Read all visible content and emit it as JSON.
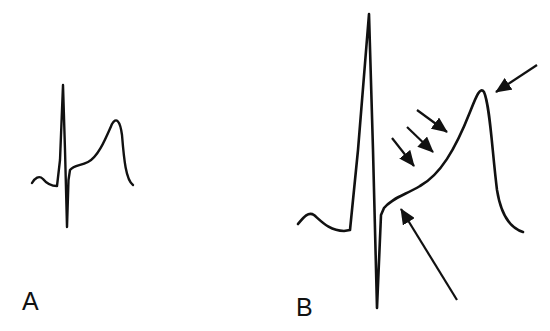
{
  "figure": {
    "panels": [
      {
        "id": "A",
        "label": "A"
      },
      {
        "id": "B",
        "label": "B"
      }
    ],
    "colors": {
      "ink": "#111111",
      "background": "#ffffff"
    },
    "annotations": {
      "panel_B_arrows": [
        {
          "name": "t-wave-peak-arrow",
          "points_to": "T wave peak"
        },
        {
          "name": "st-slope-arrow-1",
          "points_to": "ST segment upslope"
        },
        {
          "name": "st-slope-arrow-2",
          "points_to": "ST segment upslope"
        },
        {
          "name": "st-slope-arrow-3",
          "points_to": "ST segment upslope"
        },
        {
          "name": "j-point-arrow",
          "points_to": "J point"
        }
      ]
    }
  }
}
